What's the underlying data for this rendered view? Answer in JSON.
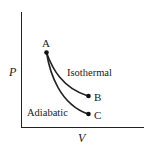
{
  "diagram": {
    "axes": {
      "y_label": "P",
      "x_label": "V"
    },
    "points": [
      {
        "id": "A",
        "label": "A"
      },
      {
        "id": "B",
        "label": "B"
      },
      {
        "id": "C",
        "label": "C"
      }
    ],
    "curves": [
      {
        "name": "isothermal",
        "label": "Isothermal",
        "from": "A",
        "to": "B"
      },
      {
        "name": "adiabatic",
        "label": "Adiabatic",
        "from": "A",
        "to": "C"
      }
    ],
    "colors": {
      "stroke": "#222222",
      "background": "#ffffff"
    }
  }
}
